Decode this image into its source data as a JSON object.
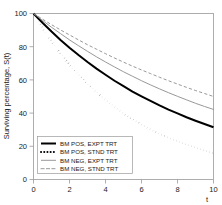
{
  "chart_data": {
    "type": "line",
    "title": "",
    "xlabel": "t",
    "ylabel": "Surviving percentage, S(t)",
    "xlim": [
      0,
      10
    ],
    "ylim": [
      0,
      100
    ],
    "xticks": [
      "0",
      "2",
      "4",
      "6",
      "8",
      "10"
    ],
    "xtick_values": [
      0,
      2,
      4,
      6,
      8,
      10
    ],
    "yticks": [
      "0",
      "20",
      "40",
      "60",
      "80",
      "100"
    ],
    "ytick_values": [
      0,
      20,
      40,
      60,
      80,
      100
    ],
    "grid": false,
    "legend_position": "lower-left",
    "x": [
      0,
      0.5,
      1,
      1.5,
      2,
      2.5,
      3,
      3.5,
      4,
      4.5,
      5,
      5.5,
      6,
      6.5,
      7,
      7.5,
      8,
      8.5,
      9,
      9.5,
      10
    ],
    "series": [
      {
        "name": "BM POS, EXPT TRT",
        "style": "solid",
        "width": "thick",
        "color": "#000000",
        "values": [
          100,
          94.4,
          89.1,
          84.1,
          79.4,
          75.0,
          70.8,
          66.8,
          63.1,
          59.5,
          56.2,
          53.0,
          50.1,
          47.3,
          44.6,
          42.1,
          39.8,
          37.5,
          35.4,
          33.4,
          31.5
        ]
      },
      {
        "name": "BM POS, STND TRT",
        "style": "dotted",
        "width": "thick",
        "color": "#000000",
        "values": [
          100,
          91.2,
          83.2,
          75.9,
          69.2,
          63.1,
          57.5,
          52.5,
          47.9,
          43.7,
          39.8,
          36.3,
          33.1,
          30.2,
          27.5,
          25.1,
          22.9,
          20.9,
          19.1,
          17.4,
          15.8
        ]
      },
      {
        "name": "BM NEG, EXPT TRT",
        "style": "solid",
        "width": "thin",
        "color": "#8c8c8c",
        "values": [
          100,
          95.8,
          91.7,
          87.9,
          84.1,
          80.6,
          77.2,
          73.9,
          70.8,
          67.8,
          64.9,
          62.2,
          59.5,
          57.0,
          54.6,
          52.3,
          50.1,
          48.0,
          45.9,
          44.0,
          42.2
        ]
      },
      {
        "name": "BM NEG, STND TRT",
        "style": "dashed",
        "width": "thin",
        "color": "#8c8c8c",
        "values": [
          100,
          96.6,
          93.3,
          90.1,
          87.1,
          84.1,
          81.2,
          78.5,
          75.8,
          73.2,
          70.7,
          68.3,
          66.0,
          63.8,
          61.6,
          59.5,
          57.5,
          55.5,
          53.6,
          51.8,
          50.0
        ]
      }
    ]
  },
  "legend": {
    "items": [
      {
        "label": "BM POS, EXPT TRT"
      },
      {
        "label": "BM POS, STND TRT"
      },
      {
        "label": "BM NEG, EXPT TRT"
      },
      {
        "label": "BM NEG, STND TRT"
      }
    ]
  },
  "colors": {
    "positive_group": "#000000",
    "negative_group": "#8c8c8c",
    "axis": "#9a9a9a",
    "text": "#1a1a1a",
    "background": "#ffffff"
  }
}
